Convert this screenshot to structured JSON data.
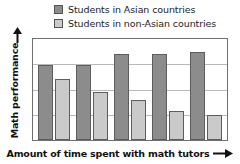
{
  "chart_data": {
    "type": "bar",
    "title": "",
    "xlabel": "Amount of time spent with math tutors",
    "ylabel": "Math performance",
    "categories": [
      "1",
      "2",
      "3",
      "4",
      "5"
    ],
    "series": [
      {
        "name": "Students in Asian countries",
        "color": "#8c8c8c",
        "values": [
          74,
          74,
          85,
          85,
          87
        ]
      },
      {
        "name": "Students in non-Asian countries",
        "color": "#cacaca",
        "values": [
          60,
          48,
          40,
          29,
          25
        ]
      }
    ],
    "ylim": [
      0,
      100
    ],
    "xlim_note": "ordinal, unlabeled increasing time",
    "grid": true,
    "gridline_positions": [
      25,
      50,
      75
    ],
    "x_tick_labels": [],
    "y_tick_labels": [],
    "legend_position": "top-center",
    "axis_arrows": {
      "y": "up",
      "x": "right"
    }
  },
  "legend": {
    "items": [
      {
        "label": "Students in Asian countries",
        "swatch": "#8c8c8c"
      },
      {
        "label": "Students in non-Asian countries",
        "swatch": "#cacaca"
      }
    ]
  },
  "axes": {
    "y_title": "Math performance",
    "x_title": "Amount of time spent with math tutors"
  },
  "icons": {
    "y_arrow": "arrow-up-icon",
    "x_arrow": "arrow-right-icon"
  }
}
